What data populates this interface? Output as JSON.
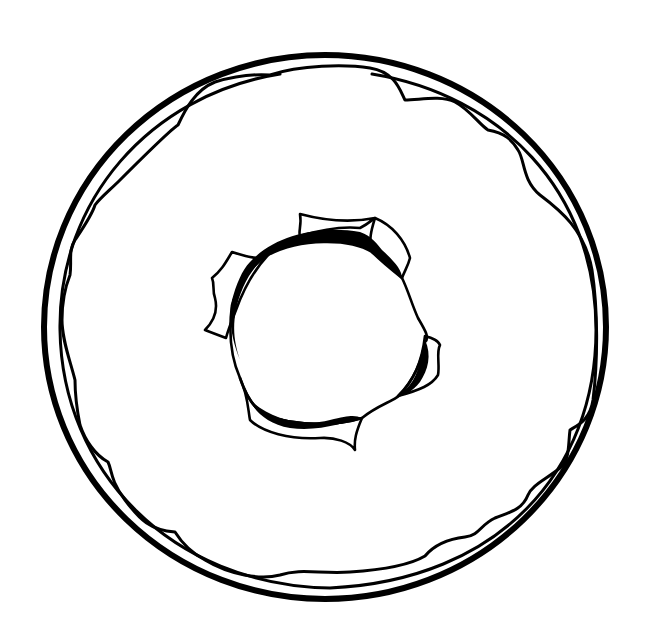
{
  "image": {
    "subject": "donut",
    "style": "black line-art coloring page",
    "colors": {
      "line": "#000000",
      "background": "#ffffff"
    },
    "parts": [
      {
        "name": "donut-outer-edge"
      },
      {
        "name": "donut-inner-rim"
      },
      {
        "name": "icing-outline"
      },
      {
        "name": "donut-hole"
      }
    ]
  }
}
